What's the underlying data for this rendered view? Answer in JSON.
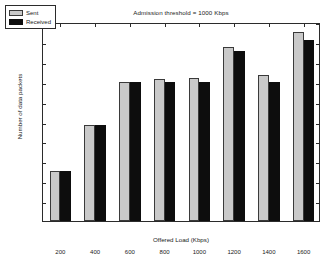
{
  "chart_data": {
    "type": "bar",
    "title": "Admission threshold = 1000 Kbps",
    "xlabel": "Offered Load (Kbps)",
    "ylabel": "Number of data packets",
    "exponent_label": "x 10",
    "exponent_value": "4",
    "categories": [
      "200",
      "400",
      "600",
      "800",
      "1000",
      "1200",
      "1400",
      "1600"
    ],
    "series": [
      {
        "name": "Sent",
        "color": "#c9c9c9",
        "values": [
          0.5,
          0.96,
          1.4,
          1.43,
          1.44,
          1.75,
          1.47,
          1.9
        ]
      },
      {
        "name": "Received",
        "color": "#0d0d0d",
        "values": [
          0.5,
          0.96,
          1.4,
          1.4,
          1.4,
          1.71,
          1.4,
          1.82
        ]
      }
    ],
    "ylim": [
      0,
      2
    ],
    "yticks": [
      "0.2",
      "0.4",
      "0.6",
      "0.8",
      "1",
      "1.2",
      "1.4",
      "1.6",
      "1.8",
      "2"
    ],
    "ytick_values": [
      0.2,
      0.4,
      0.6,
      0.8,
      1.0,
      1.2,
      1.4,
      1.6,
      1.8,
      2.0
    ],
    "grid": false,
    "legend_position": "top-left"
  }
}
